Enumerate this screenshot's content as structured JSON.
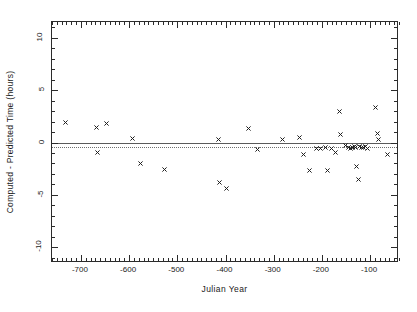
{
  "chart_data": {
    "type": "scatter",
    "title": "",
    "xlabel": "Julian Year",
    "ylabel": "Computed - Predicted Time (hours)",
    "xlim": [
      -760,
      -40
    ],
    "ylim": [
      -11.5,
      11.5
    ],
    "xticks": [
      -700,
      -600,
      -500,
      -400,
      -300,
      -200,
      -100
    ],
    "xticklabels": [
      "-700",
      "-600",
      "-500",
      "-400",
      "-300",
      "-200",
      "-100"
    ],
    "yticks": [
      10,
      5,
      0,
      -5,
      -10
    ],
    "yticklabels": [
      "10",
      "5",
      "0",
      "-5",
      "-10"
    ],
    "xtick_minor_step": 10,
    "ytick_minor_step": 1,
    "grid": false,
    "legend": null,
    "marker": "cross-x",
    "marker_color": "#1e1e1e",
    "reference_lines": [
      {
        "name": "zero-line",
        "y": 0.0,
        "style": "solid",
        "color": "#5a5a5a"
      },
      {
        "name": "mean-offset-line",
        "y": -0.45,
        "style": "dotted",
        "color": "#6e6e6e"
      }
    ],
    "series": [
      {
        "name": "Computed minus Predicted Time",
        "points": [
          [
            -731,
            1.95
          ],
          [
            -668,
            1.45
          ],
          [
            -647,
            1.85
          ],
          [
            -666,
            -0.95
          ],
          [
            -592,
            0.35
          ],
          [
            -576,
            -2.05
          ],
          [
            -527,
            -2.55
          ],
          [
            -414,
            0.25
          ],
          [
            -412,
            -3.85
          ],
          [
            -397,
            -4.35
          ],
          [
            -352,
            1.35
          ],
          [
            -334,
            -0.65
          ],
          [
            -281,
            0.25
          ],
          [
            -246,
            0.45
          ],
          [
            -238,
            -1.15
          ],
          [
            -226,
            -2.65
          ],
          [
            -212,
            -0.55
          ],
          [
            -203,
            -0.55
          ],
          [
            -193,
            -0.45
          ],
          [
            -189,
            -2.65
          ],
          [
            -180,
            -0.55
          ],
          [
            -172,
            -0.95
          ],
          [
            -163,
            2.95
          ],
          [
            -161,
            0.75
          ],
          [
            -150,
            -0.25
          ],
          [
            -144,
            -0.45
          ],
          [
            -140,
            -0.55
          ],
          [
            -137,
            -0.45
          ],
          [
            -133,
            -0.35
          ],
          [
            -130,
            -0.45
          ],
          [
            -128,
            -2.25
          ],
          [
            -124,
            -3.55
          ],
          [
            -121,
            -0.35
          ],
          [
            -118,
            -0.45
          ],
          [
            -113,
            -0.45
          ],
          [
            -110,
            -0.35
          ],
          [
            -106,
            -0.55
          ],
          [
            -88,
            3.35
          ],
          [
            -85,
            0.85
          ],
          [
            -82,
            0.25
          ],
          [
            -64,
            -1.15
          ]
        ]
      }
    ]
  }
}
